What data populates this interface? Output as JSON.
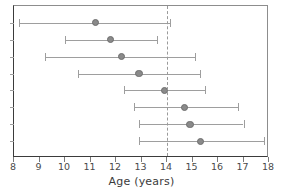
{
  "chart_data": {
    "type": "scatter",
    "variant": "forest-plot-confidence-intervals",
    "title": "",
    "xlabel": "Age  (years)",
    "ylabel": "",
    "xlim": [
      8,
      18
    ],
    "ylim": [
      0,
      9
    ],
    "xticks": [
      8,
      9,
      10,
      11,
      12,
      13,
      14,
      15,
      16,
      17,
      18
    ],
    "xticklabels": [
      "8",
      "9",
      "10",
      "11",
      "12",
      "13",
      "14",
      "15",
      "16",
      "17",
      "18"
    ],
    "yticks": [
      1,
      2,
      3,
      4,
      5,
      6,
      7,
      8
    ],
    "yticklabels": [
      "",
      "",
      "",
      "",
      "",
      "",
      "",
      ""
    ],
    "grid": false,
    "legend": null,
    "reference_line": {
      "orientation": "vertical",
      "value": 14,
      "style": "dashed",
      "color": "#9a9a9a"
    },
    "marker_color": "#8a8a8a",
    "interval_color": "#9e9e9e",
    "series": [
      {
        "name": "estimate",
        "points": [
          {
            "row": 1,
            "x": 11.2,
            "low": 8.2,
            "high": 14.1
          },
          {
            "row": 2,
            "x": 11.8,
            "low": 10.0,
            "high": 13.6
          },
          {
            "row": 3,
            "x": 12.2,
            "low": 9.2,
            "high": 15.1
          },
          {
            "row": 4,
            "x": 12.9,
            "low": 10.5,
            "high": 15.3
          },
          {
            "row": 5,
            "x": 13.9,
            "low": 12.3,
            "high": 15.5
          },
          {
            "row": 6,
            "x": 14.7,
            "low": 12.7,
            "high": 16.8
          },
          {
            "row": 7,
            "x": 14.9,
            "low": 12.9,
            "high": 17.0
          },
          {
            "row": 8,
            "x": 15.3,
            "low": 12.9,
            "high": 17.8
          }
        ]
      }
    ]
  },
  "axis": {
    "title": "Age  (years)"
  }
}
